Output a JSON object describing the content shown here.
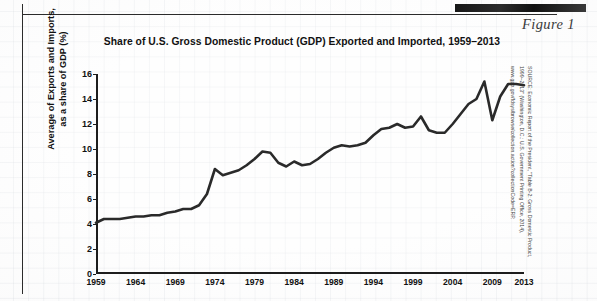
{
  "figure": {
    "label": "Figure 1",
    "title": "Share of U.S. Gross Domestic Product (GDP) Exported and Imported, 1959–2013",
    "source": "SOURCE: Economic Report of the President, \"Table B-2: Gross Domestic Product,\n1999–2013\" (Washington, D.C.: U.S. Government Printing Office, 2014),\nwww.gpo.gov/fdsys/browse/collection.action?collectionCode=ERP."
  },
  "chart_data": {
    "type": "line",
    "title": "Share of U.S. Gross Domestic Product (GDP) Exported and Imported, 1959–2013",
    "xlabel": "",
    "ylabel": "Average of Exports and Imports,\nas a share of GDP (%)",
    "ylabel_line1": "Average of Exports and Imports,",
    "ylabel_line2": "as a share of GDP (%)",
    "xlim": [
      1959,
      2013
    ],
    "ylim": [
      0,
      16
    ],
    "yticks": [
      0,
      2,
      4,
      6,
      8,
      10,
      12,
      14,
      16
    ],
    "xticks": [
      1959,
      1964,
      1969,
      1974,
      1979,
      1984,
      1989,
      1994,
      1999,
      2004,
      2009,
      2013
    ],
    "grid": false,
    "legend": "none",
    "line_color": "#2a2a2a",
    "series": [
      {
        "name": "Average of exports and imports as a share of GDP",
        "x": [
          1959,
          1960,
          1961,
          1962,
          1963,
          1964,
          1965,
          1966,
          1967,
          1968,
          1969,
          1970,
          1971,
          1972,
          1973,
          1974,
          1975,
          1976,
          1977,
          1978,
          1979,
          1980,
          1981,
          1982,
          1983,
          1984,
          1985,
          1986,
          1987,
          1988,
          1989,
          1990,
          1991,
          1992,
          1993,
          1994,
          1995,
          1996,
          1997,
          1998,
          1999,
          2000,
          2001,
          2002,
          2003,
          2004,
          2005,
          2006,
          2007,
          2008,
          2009,
          2010,
          2011,
          2012,
          2013
        ],
        "values": [
          4.1,
          4.4,
          4.4,
          4.4,
          4.5,
          4.6,
          4.6,
          4.7,
          4.7,
          4.9,
          5.0,
          5.2,
          5.2,
          5.5,
          6.4,
          8.4,
          7.9,
          8.1,
          8.3,
          8.7,
          9.2,
          9.8,
          9.7,
          8.9,
          8.6,
          9.0,
          8.7,
          8.8,
          9.2,
          9.7,
          10.1,
          10.3,
          10.2,
          10.3,
          10.5,
          11.1,
          11.6,
          11.7,
          12.0,
          11.7,
          11.8,
          12.6,
          11.5,
          11.3,
          11.3,
          12.0,
          12.8,
          13.6,
          14.0,
          15.4,
          12.3,
          14.2,
          15.2,
          15.2,
          15.1
        ],
        "peak_1974": 8.4,
        "peak_1980": 9.8,
        "peak_2000": 12.6,
        "peak_2008": 15.4,
        "trough_2009": 12.3,
        "final_2013": 15.1
      }
    ]
  },
  "yticks_text": [
    "0",
    "2",
    "4",
    "6",
    "8",
    "10",
    "12",
    "14",
    "16"
  ],
  "xticks_text": [
    "1959",
    "1964",
    "1969",
    "1974",
    "1979",
    "1984",
    "1989",
    "1994",
    "1999",
    "2004",
    "2009",
    "2013"
  ]
}
